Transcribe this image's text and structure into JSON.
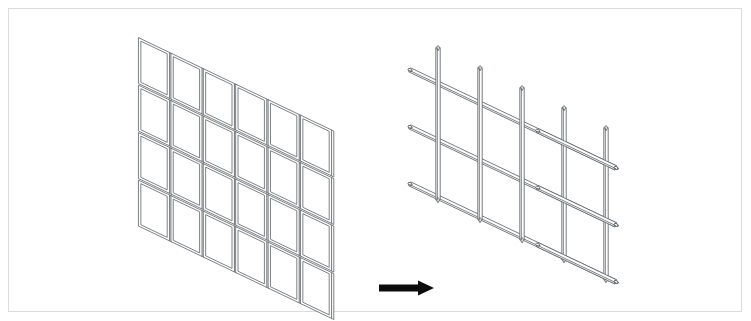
{
  "diagram": {
    "background_color": "#ffffff",
    "border_color": "#dcdcdc",
    "line_color": "#666a6e",
    "arrow_color": "#0c0c0c",
    "left_figure": {
      "name": "panel-grid",
      "label": "Panel grid assembly",
      "columns": 6,
      "rows": 4,
      "projection": "isometric",
      "element_type": "rectangular panel frame",
      "origin_x": 138,
      "origin_y": 37,
      "cell_width": 32.4,
      "cell_height": 47.5,
      "col_drop": 15.5,
      "gap": 1.6,
      "frame_inset": 2.4
    },
    "right_figure": {
      "name": "rod-lattice",
      "label": "Rod lattice assembly",
      "vertical_rods": 5,
      "horizontal_rods": 3,
      "projection": "isometric",
      "element_type": "round rod",
      "rod_thickness": 4.4,
      "origin_x": 424,
      "origin_y": 58,
      "v_spacing": 42,
      "v_drop": 20,
      "v_length": 152,
      "h_spacing": 57,
      "h_length": 206,
      "h_rise": 98
    },
    "arrow": {
      "name": "transformation-arrow",
      "direction": "right",
      "x": 379,
      "y": 288,
      "length": 55,
      "shaft_thickness": 7,
      "head_width": 16,
      "head_height": 15
    }
  }
}
